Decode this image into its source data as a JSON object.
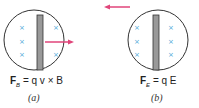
{
  "panels": [
    {
      "id": "a",
      "equation": {
        "lhs": "F",
        "sub": "B",
        "rhs": " = q v × B"
      },
      "caption": "(a)",
      "arrow_direction": "right"
    },
    {
      "id": "b",
      "equation": {
        "lhs": "F",
        "sub": "E",
        "rhs": " = q E"
      },
      "caption": "(b)",
      "arrow_direction": "left"
    }
  ],
  "colors": {
    "cross": "#4aa8d8",
    "arrow": "#e0457a",
    "rod": "#888888",
    "circle": "#333333"
  }
}
